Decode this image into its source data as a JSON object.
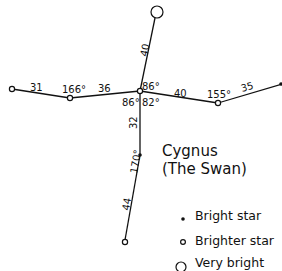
{
  "title": {
    "line1": "Cygnus",
    "line2": "(The Swan)"
  },
  "segments": {
    "far_left": "31",
    "left": "36",
    "top": "40",
    "right": "40",
    "far_right": "35",
    "lower": "32",
    "bottom": "44"
  },
  "angles": {
    "left_star": "166°",
    "center_upper_right": "86°",
    "center_lower_left": "86°",
    "center_lower_right": "82°",
    "right_star": "155°",
    "lower_star": "170°"
  },
  "legend": {
    "bright": "Bright star",
    "brighter": "Brighter star",
    "very_bright": "Very bright"
  },
  "colors": {
    "ink": "#111111",
    "background": "#ffffff"
  }
}
